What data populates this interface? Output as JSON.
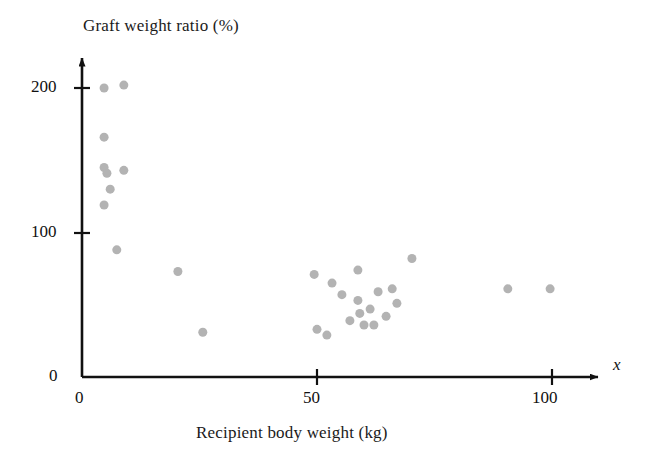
{
  "chart_data": {
    "type": "scatter",
    "title": "",
    "xlabel": "Recipient body weight (kg)",
    "ylabel": "Graft weight ratio (%)",
    "x_variable_symbol": "x",
    "xlim": [
      0,
      110
    ],
    "ylim": [
      0,
      225
    ],
    "xticks": [
      0,
      50,
      100
    ],
    "xticklabels": [
      "0",
      "50",
      "100"
    ],
    "yticks": [
      0,
      100,
      200
    ],
    "yticklabels": [
      "0",
      "100",
      "200"
    ],
    "grid": false,
    "legend": null,
    "marker": {
      "shape": "circle",
      "color": "#b3b3b3",
      "size_px": 9
    },
    "axis_color": "#111111",
    "n_points": 30,
    "points": [
      {
        "x": 4.7,
        "y": 200
      },
      {
        "x": 8.9,
        "y": 202
      },
      {
        "x": 4.7,
        "y": 166
      },
      {
        "x": 4.7,
        "y": 145
      },
      {
        "x": 5.3,
        "y": 141
      },
      {
        "x": 8.9,
        "y": 143
      },
      {
        "x": 6.0,
        "y": 130
      },
      {
        "x": 4.7,
        "y": 119
      },
      {
        "x": 7.4,
        "y": 88
      },
      {
        "x": 20.4,
        "y": 73
      },
      {
        "x": 25.7,
        "y": 31
      },
      {
        "x": 49.4,
        "y": 71
      },
      {
        "x": 53.2,
        "y": 65
      },
      {
        "x": 50.0,
        "y": 33
      },
      {
        "x": 52.1,
        "y": 29
      },
      {
        "x": 58.7,
        "y": 74
      },
      {
        "x": 58.7,
        "y": 53
      },
      {
        "x": 57.0,
        "y": 39
      },
      {
        "x": 60.0,
        "y": 36
      },
      {
        "x": 61.3,
        "y": 47
      },
      {
        "x": 62.1,
        "y": 36
      },
      {
        "x": 63.0,
        "y": 59
      },
      {
        "x": 64.7,
        "y": 42
      },
      {
        "x": 66.0,
        "y": 61
      },
      {
        "x": 70.2,
        "y": 82
      },
      {
        "x": 67.0,
        "y": 51
      },
      {
        "x": 90.6,
        "y": 61
      },
      {
        "x": 99.6,
        "y": 61
      },
      {
        "x": 59.1,
        "y": 44
      },
      {
        "x": 55.3,
        "y": 57
      }
    ]
  },
  "axis_geometry": {
    "x_origin_px": 82,
    "y_origin_px": 377,
    "px_per_x_unit": 4.7,
    "px_per_y_unit": 1.445,
    "x_axis_end_px": 600,
    "y_axis_top_px": 55
  }
}
